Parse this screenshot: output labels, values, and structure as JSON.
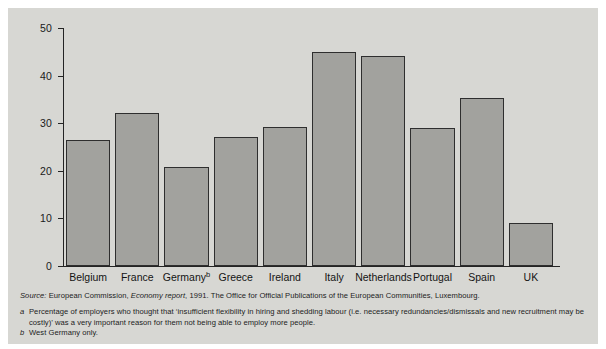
{
  "chart_data": {
    "type": "bar",
    "title": "",
    "subtitle": "",
    "xlabel": "",
    "ylabel": "",
    "ylim": [
      0,
      50
    ],
    "yticks": [
      0,
      10,
      20,
      30,
      40,
      50
    ],
    "grid": false,
    "legend": null,
    "categories": [
      "Belgium",
      "France",
      "Germany",
      "Greece",
      "Ireland",
      "Italy",
      "Netherlands",
      "Portugal",
      "Spain",
      "UK"
    ],
    "category_labels": [
      "Belgium",
      "France",
      "Germanyᵇ",
      "Greece",
      "Ireland",
      "Italy",
      "Netherlands",
      "Portugal",
      "Spain",
      "UK"
    ],
    "values": [
      26.5,
      32.1,
      20.8,
      27.0,
      29.2,
      45.0,
      44.2,
      29.0,
      35.3,
      9.0
    ],
    "bar_fill_color": "#a2a29e",
    "bar_edge_color": "#2e2e2e",
    "plot_background_color": "#d7d7d3"
  },
  "axis": {
    "y_tick_labels": [
      "50",
      "40",
      "30",
      "20",
      "10",
      "0"
    ]
  },
  "notes": {
    "source_label": "Source:",
    "source_text_1": " European Commission, ",
    "source_italic": "Economy report",
    "source_text_2": ", 1991. The Office for Official Publications of the European Communities, Luxembourg.",
    "footnote_a_marker": "a",
    "footnote_a_text": "Percentage of employers who thought that ‘insufficient flexibility in hiring and shedding labour (i.e. necessary redundancies/dismissals and new recruitment may be costly)’ was a very important reason for them not being able to employ more people.",
    "footnote_b_marker": "b",
    "footnote_b_text": "West Germany only."
  }
}
